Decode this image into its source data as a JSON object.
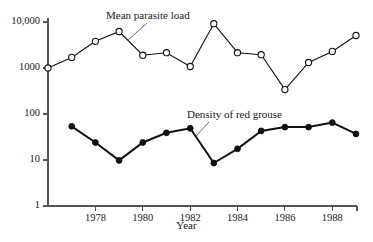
{
  "chart_data": {
    "type": "line",
    "title": "",
    "xlabel": "Year",
    "ylabel": "",
    "yscale": "log",
    "ylim": [
      1,
      10000
    ],
    "xlim": [
      1976,
      1989
    ],
    "grid": false,
    "legend": "annotations-inline",
    "x": [
      1976,
      1977,
      1978,
      1979,
      1980,
      1981,
      1982,
      1983,
      1984,
      1985,
      1986,
      1987,
      1988,
      1989
    ],
    "ytick_labels": [
      "10,000",
      "1000",
      "100",
      "10",
      "1"
    ],
    "ytick_values": [
      10000,
      1000,
      100,
      10,
      1
    ],
    "xtick_labels": [
      "1978",
      "1980",
      "1982",
      "1984",
      "1986",
      "1988"
    ],
    "xtick_values": [
      1978,
      1980,
      1982,
      1984,
      1986,
      1988
    ],
    "series": [
      {
        "name": "Mean parasite load",
        "marker": "open-circle",
        "x": [
          1976,
          1977,
          1978,
          1979,
          1980,
          1981,
          1982,
          1983,
          1984,
          1985,
          1986,
          1987,
          1988,
          1989
        ],
        "values": [
          1000,
          1700,
          3800,
          6200,
          1900,
          2150,
          1080,
          9200,
          2150,
          1950,
          340,
          1320,
          2300,
          5100
        ]
      },
      {
        "name": "Density of red grouse",
        "marker": "filled-circle",
        "x": [
          1977,
          1978,
          1979,
          1980,
          1981,
          1982,
          1983,
          1984,
          1985,
          1986,
          1987,
          1988,
          1989
        ],
        "values": [
          54,
          24,
          9.8,
          24,
          39,
          49,
          8.6,
          17.5,
          43,
          52,
          52,
          65,
          37
        ]
      }
    ],
    "annotations": [
      {
        "text": "Mean parasite load",
        "label_x": 106,
        "label_y": 9,
        "leader_from": [
          127,
          41
        ],
        "leader_to": [
          147,
          23
        ]
      },
      {
        "text": "Density of red grouse",
        "label_x": 187,
        "label_y": 108,
        "leader_from": [
          196,
          136
        ],
        "leader_to": [
          209,
          122
        ]
      }
    ],
    "colors": {
      "axis": "#555555",
      "line": "#111111",
      "open_marker_fill": "#ffffff",
      "filled_marker_fill": "#111111",
      "background": "#ffffff"
    }
  },
  "axis_titles": {
    "x": "Year"
  }
}
